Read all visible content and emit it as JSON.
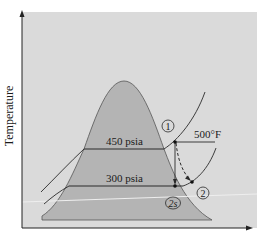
{
  "diagram": {
    "type": "T-s diagram (steam turbine expansion)",
    "y_axis_label": "Temperature",
    "x_axis_label": "",
    "isobars": [
      {
        "label": "450 psia"
      },
      {
        "label": "300 psia"
      }
    ],
    "isotherm_label": "500°F",
    "states": [
      {
        "id": "1",
        "label": "1"
      },
      {
        "id": "2",
        "label": "2"
      },
      {
        "id": "2s",
        "label": "2s"
      }
    ],
    "colors": {
      "panel": "#dadada",
      "dome": "#b4b4b4",
      "line": "#2a2a2a",
      "background": "#ffffff"
    }
  }
}
